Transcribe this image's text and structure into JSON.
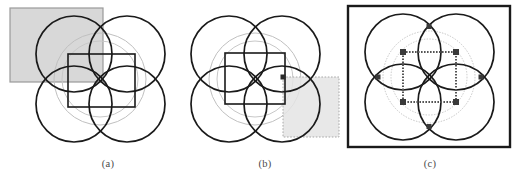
{
  "figure": {
    "type": "geometric-diagram",
    "width": 518,
    "height": 183,
    "background": "#ffffff"
  },
  "colors": {
    "stroke_dark": "#1a1a1a",
    "stroke_medium": "#555555",
    "stroke_light": "#aaaaaa",
    "stroke_faint": "#c8c8c8",
    "shade_fill": "#d8d8d8",
    "shade_fill_light": "#e2e2e2",
    "caption_text": "#4a4a4a",
    "background": "#ffffff"
  },
  "panels": [
    {
      "id": "a",
      "caption": "(a)",
      "caption_x": 108,
      "caption_y": 165,
      "center_x": 100,
      "center_y": 78,
      "circles_dark": [
        {
          "cx": 74,
          "cy": 54,
          "r": 38
        },
        {
          "cx": 127,
          "cy": 54,
          "r": 38
        },
        {
          "cx": 74,
          "cy": 104,
          "r": 38
        },
        {
          "cx": 127,
          "cy": 104,
          "r": 38
        }
      ],
      "circles_light": [
        {
          "cx": 100,
          "cy": 79,
          "r": 46
        },
        {
          "cx": 100,
          "cy": 79,
          "r": 38
        }
      ],
      "inner_square": {
        "x": 68,
        "y": 54,
        "w": 67,
        "h": 53,
        "stroke": "#1a1a1a",
        "style": "solid"
      },
      "shaded_region": {
        "x": 10,
        "y": 8,
        "w": 93,
        "h": 74,
        "fill": "#d8d8d8",
        "stroke": "#9a9a9a",
        "style": "solid"
      }
    },
    {
      "id": "b",
      "caption": "(b)",
      "caption_x": 265,
      "caption_y": 165,
      "center_x": 255,
      "center_y": 78,
      "circles_dark": [
        {
          "cx": 229,
          "cy": 54,
          "r": 38
        },
        {
          "cx": 282,
          "cy": 54,
          "r": 38
        },
        {
          "cx": 229,
          "cy": 104,
          "r": 38
        },
        {
          "cx": 282,
          "cy": 104,
          "r": 38
        }
      ],
      "circles_light": [
        {
          "cx": 255,
          "cy": 79,
          "r": 46
        },
        {
          "cx": 255,
          "cy": 79,
          "r": 38
        }
      ],
      "inner_square": {
        "x": 225,
        "y": 53,
        "w": 60,
        "h": 51,
        "stroke": "#1a1a1a",
        "style": "solid"
      },
      "shaded_region": {
        "x": 283,
        "y": 77,
        "w": 56,
        "h": 60,
        "fill": "#e2e2e2",
        "stroke": "#b0b0b0",
        "style": "dotted"
      },
      "marker": {
        "x": 283,
        "y": 77,
        "size": 3
      }
    },
    {
      "id": "c",
      "caption": "(c)",
      "caption_x": 430,
      "caption_y": 165,
      "center_x": 429,
      "center_y": 76,
      "outer_border": {
        "x": 348,
        "y": 6,
        "w": 162,
        "h": 141,
        "stroke": "#1a1a1a",
        "width": 2.5
      },
      "circles_dark": [
        {
          "cx": 403,
          "cy": 52,
          "r": 38
        },
        {
          "cx": 456,
          "cy": 52,
          "r": 38
        },
        {
          "cx": 403,
          "cy": 102,
          "r": 38
        },
        {
          "cx": 456,
          "cy": 102,
          "r": 38
        }
      ],
      "circles_light": [
        {
          "cx": 429,
          "cy": 77,
          "r": 46
        },
        {
          "cx": 429,
          "cy": 77,
          "r": 38
        }
      ],
      "inner_square": {
        "x": 403,
        "y": 52,
        "w": 53,
        "h": 50,
        "stroke": "#555555",
        "style": "dotted"
      },
      "markers": [
        {
          "x": 403,
          "y": 52,
          "label": "top-left-node"
        },
        {
          "x": 456,
          "y": 52,
          "label": "top-right-node"
        },
        {
          "x": 403,
          "y": 102,
          "label": "bottom-left-node"
        },
        {
          "x": 456,
          "y": 102,
          "label": "bottom-right-node"
        },
        {
          "x": 429,
          "y": 27,
          "label": "top-node"
        },
        {
          "x": 429,
          "y": 127,
          "label": "bottom-node"
        },
        {
          "x": 378,
          "y": 77,
          "label": "left-node"
        },
        {
          "x": 481,
          "y": 77,
          "label": "right-node"
        }
      ]
    }
  ]
}
